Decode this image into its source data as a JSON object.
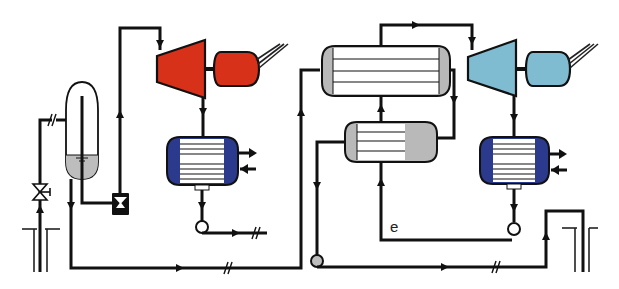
{
  "diagram": {
    "type": "process-flow-diagram",
    "labels": {
      "e": "e"
    },
    "colors": {
      "background": "#ffffff",
      "pipe": "#111111",
      "steam_turbine": "#d8311a",
      "steam_generator": "#d8311a",
      "orc_turbine": "#7fbcd2",
      "orc_generator": "#7fbcd2",
      "condenser_shell": "#2b3a8c",
      "hx_end_caps": "#b9b9b9",
      "separator_liquid": "#bdbdbd",
      "pump_body": "#111111"
    },
    "components": [
      {
        "id": "production-well",
        "name": "Production well"
      },
      {
        "id": "wellhead-valve",
        "name": "Wellhead valve"
      },
      {
        "id": "separator",
        "name": "Separator (flash tank)"
      },
      {
        "id": "brine-pump",
        "name": "Brine pump"
      },
      {
        "id": "steam-turbine",
        "name": "Steam turbine"
      },
      {
        "id": "steam-generator",
        "name": "Generator 1"
      },
      {
        "id": "steam-condenser",
        "name": "Steam condenser"
      },
      {
        "id": "condensate-pump",
        "name": "Condensate pump"
      },
      {
        "id": "vaporizer",
        "name": "Vaporizer / evaporator"
      },
      {
        "id": "preheater",
        "name": "Preheater"
      },
      {
        "id": "orc-turbine",
        "name": "ORC turbine"
      },
      {
        "id": "orc-generator",
        "name": "Generator 2"
      },
      {
        "id": "orc-condenser",
        "name": "ORC condenser"
      },
      {
        "id": "orc-feed-pump",
        "name": "ORC feed pump"
      },
      {
        "id": "brine-pump-2",
        "name": "Brine circulation pump"
      },
      {
        "id": "injection-well",
        "name": "Injection well"
      }
    ]
  }
}
